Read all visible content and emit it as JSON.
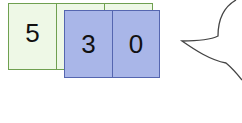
{
  "green_cards": [
    {
      "digit": "5"
    },
    {
      "digit": ""
    },
    {
      "digit": ""
    }
  ],
  "blue_cards": [
    {
      "digit": "3"
    },
    {
      "digit": "0"
    }
  ],
  "colors": {
    "green_fill": "#eef8e6",
    "green_border": "#6fa050",
    "blue_fill": "#a9b6e8",
    "blue_border": "#5566b0",
    "bubble_stroke": "#444444"
  }
}
